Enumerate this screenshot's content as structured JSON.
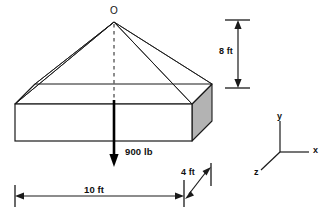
{
  "figure": {
    "apex_label": "O",
    "load_label": "900 lb",
    "height_label": "8 ft",
    "length_label": "10 ft",
    "depth_label": "4 ft",
    "axes": {
      "y_label": "y",
      "x_label": "x",
      "z_label": "z"
    },
    "colors": {
      "line": "#1a1a1a",
      "side_face_fill": "#b3b3b3",
      "front_face_fill": "#ffffff",
      "background": "#ffffff"
    }
  }
}
